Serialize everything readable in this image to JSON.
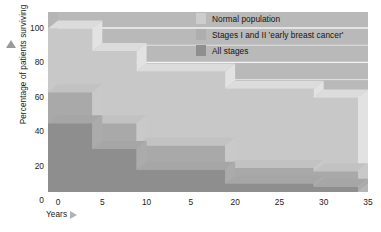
{
  "chart_data": {
    "type": "area",
    "title": "",
    "xlabel": "Years",
    "ylabel": "Percentage of patients surviving",
    "xlim": [
      0,
      35
    ],
    "ylim": [
      0,
      100
    ],
    "xticks": [
      0,
      5,
      10,
      15,
      20,
      25,
      30,
      35
    ],
    "xtick_labels": [
      "0",
      "5",
      "10",
      "5",
      "20",
      "25",
      "30",
      "35"
    ],
    "yticks": [
      0,
      20,
      40,
      60,
      80,
      100
    ],
    "ytick_labels": [
      "0",
      "20",
      "40",
      "60",
      "80",
      "100"
    ],
    "grid": "horizontal",
    "legend_position": "top-right",
    "step_edges": [
      0,
      5,
      10,
      20,
      30,
      35
    ],
    "series": [
      {
        "name": "Normal population",
        "color": "#c8c8c8",
        "top_color": "#dcdcdc",
        "side_color": "#e2e2e2",
        "values": [
          95,
          82,
          70,
          60,
          55
        ]
      },
      {
        "name": "Stages I and II 'early breast cancer'",
        "color": "#a9a9a9",
        "top_color": "#c2c2c2",
        "side_color": "#c9c9c9",
        "values": [
          58,
          40,
          27,
          14,
          12
        ]
      },
      {
        "name": "All stages",
        "color": "#8e8e8e",
        "top_color": "#a6a6a6",
        "side_color": "#ababab",
        "values": [
          40,
          25,
          13,
          5,
          3
        ]
      }
    ]
  },
  "axes": {
    "y_title": "Percentage of patients surviving",
    "x_title": "Years"
  },
  "legend": {
    "items": [
      {
        "label": "Normal population",
        "color": "#cdcdcd"
      },
      {
        "label": "Stages I and II 'early breast cancer'",
        "color": "#aeaeae"
      },
      {
        "label": "All stages",
        "color": "#8f8f8f"
      }
    ]
  }
}
